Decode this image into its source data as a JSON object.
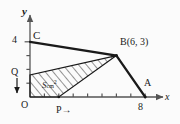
{
  "figure": {
    "kind": "coordinate-geometry-diagram",
    "axes": {
      "x_label": "x",
      "y_label": "y",
      "origin_label": "O",
      "x_tick_label": "8",
      "y_tick_label": "4",
      "x_ticks": [
        1,
        2,
        3,
        4,
        5,
        6,
        7,
        8
      ],
      "y_ticks": [
        1,
        2,
        3,
        4
      ],
      "x_range": [
        0,
        9.2
      ],
      "y_range": [
        0,
        5.2
      ]
    },
    "points": [
      {
        "name": "C",
        "label": "C",
        "x": 0,
        "y": 4
      },
      {
        "name": "B",
        "label": "B",
        "coord_label": "(6, 3)",
        "x": 6,
        "y": 3
      },
      {
        "name": "A",
        "label": "A",
        "x": 8,
        "y": 0
      },
      {
        "name": "O",
        "label": "O",
        "x": 0,
        "y": 0
      },
      {
        "name": "P",
        "label": "P",
        "x": 2,
        "y": 0,
        "motion": "right"
      },
      {
        "name": "Q",
        "label": "Q",
        "x": 0,
        "y": 1.6,
        "motion": "down"
      }
    ],
    "outline_path": [
      {
        "x": 0,
        "y": 4
      },
      {
        "x": 6,
        "y": 3
      },
      {
        "x": 8,
        "y": 0
      }
    ],
    "shaded_region": {
      "label": "S",
      "unit": "cm",
      "unit_exponent": "2",
      "vertices": [
        {
          "x": 0,
          "y": 0
        },
        {
          "x": 0,
          "y": 1.6
        },
        {
          "x": 6,
          "y": 3
        },
        {
          "x": 2,
          "y": 0
        }
      ],
      "fill": "hatch"
    },
    "arrows": {
      "p_arrow": "→",
      "q_arrow": "↓"
    },
    "colors": {
      "stroke": "#1a1a1a",
      "axis": "#555555",
      "hatch": "#333333",
      "background": "#fbfbfb"
    }
  }
}
